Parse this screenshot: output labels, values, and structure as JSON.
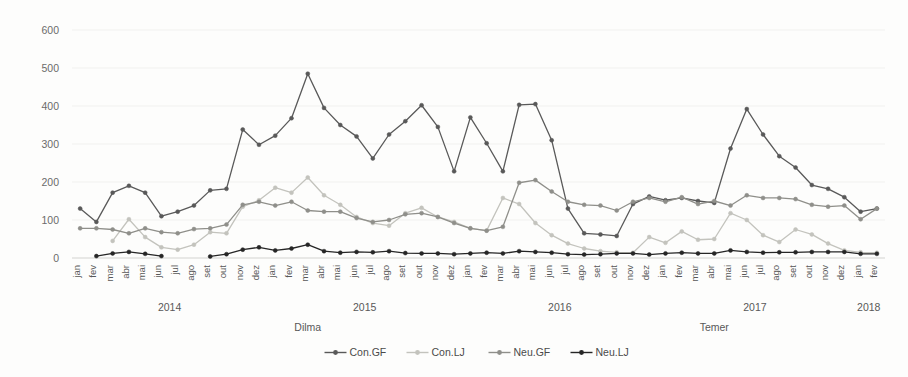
{
  "chart_data": {
    "type": "line",
    "title": "",
    "subtitle": "",
    "xlabel": "",
    "ylabel": "",
    "ylim": [
      0,
      600
    ],
    "yticks": [
      0,
      100,
      200,
      300,
      400,
      500,
      600
    ],
    "grid": true,
    "legend_position": "bottom",
    "x": [
      "jan",
      "fev",
      "mar",
      "abr",
      "mai",
      "jun",
      "jul",
      "ago",
      "set",
      "out",
      "nov",
      "dez",
      "jan",
      "fev",
      "mar",
      "abr",
      "mai",
      "jun",
      "jul",
      "ago",
      "set",
      "out",
      "nov",
      "dez",
      "jan",
      "fev",
      "mar",
      "abr",
      "mai",
      "jun",
      "jul",
      "ago",
      "set",
      "out",
      "nov",
      "dez",
      "jan",
      "fev",
      "mar",
      "abr",
      "mai",
      "jun",
      "jul",
      "ago",
      "set",
      "out",
      "nov",
      "dez",
      "jan",
      "fev"
    ],
    "year_groups": [
      {
        "label": "2014",
        "start": 0,
        "end": 11
      },
      {
        "label": "2015",
        "start": 12,
        "end": 23
      },
      {
        "label": "2016",
        "start": 24,
        "end": 35
      },
      {
        "label": "2017",
        "start": 36,
        "end": 47
      },
      {
        "label": "2018",
        "start": 48,
        "end": 49
      }
    ],
    "period_annotations": [
      {
        "label": "Dilma",
        "start": 0,
        "end": 28
      },
      {
        "label": "Temer",
        "start": 29,
        "end": 49
      }
    ],
    "series": [
      {
        "name": "Con.GF",
        "color": "#595959",
        "values": [
          130,
          95,
          172,
          190,
          172,
          110,
          122,
          138,
          178,
          182,
          338,
          298,
          322,
          368,
          485,
          395,
          350,
          320,
          262,
          325,
          360,
          402,
          345,
          228,
          370,
          302,
          228,
          403,
          405,
          310,
          130,
          65,
          62,
          58,
          142,
          162,
          152,
          158,
          150,
          145,
          288,
          392,
          325,
          268,
          238,
          192,
          182,
          160,
          122,
          130
        ]
      },
      {
        "name": "Con.LJ",
        "color": "#c3c3bd",
        "values": [
          null,
          null,
          45,
          102,
          55,
          28,
          22,
          35,
          68,
          65,
          135,
          152,
          185,
          172,
          212,
          165,
          140,
          108,
          92,
          85,
          118,
          132,
          108,
          95,
          78,
          72,
          158,
          142,
          92,
          60,
          38,
          25,
          18,
          15,
          14,
          55,
          40,
          70,
          48,
          50,
          118,
          100,
          60,
          42,
          75,
          62,
          38,
          20,
          15,
          14
        ]
      },
      {
        "name": "Neu.GF",
        "color": "#8f8f8a",
        "values": [
          78,
          78,
          75,
          65,
          78,
          68,
          65,
          76,
          78,
          88,
          140,
          148,
          138,
          148,
          125,
          122,
          122,
          105,
          95,
          100,
          115,
          118,
          108,
          92,
          78,
          72,
          82,
          198,
          205,
          175,
          148,
          140,
          138,
          125,
          148,
          158,
          148,
          160,
          142,
          150,
          138,
          165,
          158,
          158,
          155,
          140,
          135,
          138,
          102,
          130
        ]
      },
      {
        "name": "Neu.LJ",
        "color": "#262626",
        "values": [
          null,
          5,
          12,
          16,
          11,
          5,
          null,
          null,
          4,
          10,
          22,
          28,
          20,
          25,
          35,
          18,
          14,
          16,
          15,
          18,
          13,
          12,
          12,
          10,
          12,
          14,
          12,
          18,
          16,
          14,
          10,
          9,
          10,
          12,
          12,
          9,
          12,
          14,
          12,
          12,
          20,
          16,
          14,
          15,
          15,
          16,
          16,
          16,
          11,
          11
        ]
      }
    ]
  },
  "legend": {
    "items": [
      {
        "label": "Con.GF",
        "color": "#595959"
      },
      {
        "label": "Con.LJ",
        "color": "#c3c3bd"
      },
      {
        "label": "Neu.GF",
        "color": "#8f8f8a"
      },
      {
        "label": "Neu.LJ",
        "color": "#262626"
      }
    ]
  }
}
